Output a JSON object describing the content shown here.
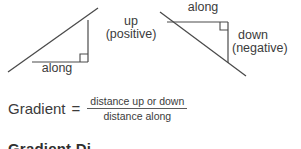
{
  "figure": {
    "left_triangle": {
      "rise_label": "up",
      "rise_sign": "(positive)",
      "run_label": "along"
    },
    "right_triangle": {
      "run_label": "along",
      "rise_label": "down",
      "rise_sign": "(negative)"
    }
  },
  "formula": {
    "term": "Gradient",
    "equals": "=",
    "numerator": "distance up or down",
    "denominator": "distance along"
  },
  "cutoff_heading": "Gradient Di",
  "colors": {
    "line": "#4a4a4a",
    "text": "#3b3b3b",
    "background": "#ffffff"
  }
}
